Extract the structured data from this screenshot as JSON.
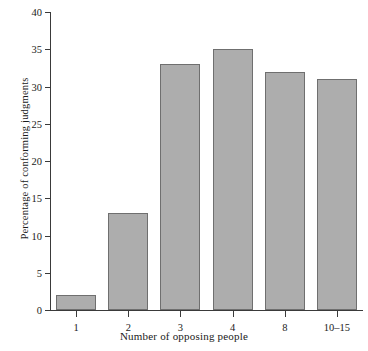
{
  "chart_data": {
    "type": "bar",
    "title": "",
    "subtitle": "",
    "xlabel": "Number of opposing people",
    "ylabel": "Percentage of conforming judgments",
    "categories": [
      "1",
      "2",
      "3",
      "4",
      "8",
      "10–15"
    ],
    "values": [
      2,
      13,
      33,
      35,
      32,
      31
    ],
    "ylim": [
      0,
      40
    ],
    "y_ticks": [
      0,
      5,
      10,
      15,
      20,
      25,
      30,
      35,
      40
    ],
    "y_tick_labels": [
      "0",
      "5",
      "10",
      "15",
      "20",
      "25",
      "30",
      "35",
      "40"
    ],
    "grid": false,
    "legend": "none",
    "bar_color": "#adadad",
    "bar_border_color": "#6f6f6f",
    "axis_color": "#3a3a3a",
    "background_color": "#ffffff"
  }
}
